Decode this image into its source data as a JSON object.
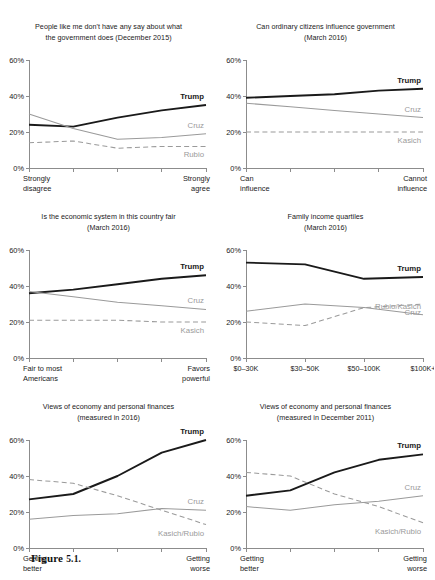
{
  "figure": {
    "caption_label": "Figure",
    "caption_number": "5.1."
  },
  "series_colors": {
    "trump": "#1a1a1a",
    "cruz": "#9a9a9a",
    "kasich": "#9a9a9a",
    "rubio": "#9a9a9a",
    "axis": "#8c8c8c",
    "text": "#1a1a1a",
    "gray_label": "#9a9a9a"
  },
  "chart_data": [
    {
      "type": "line",
      "id": "say-in-government",
      "title": "People like me don't have any say about what",
      "subtitle": "the government does (December 2015)",
      "x": [
        "1",
        "2",
        "3",
        "4",
        "5"
      ],
      "xtick_labels": [
        "",
        "",
        "",
        "",
        ""
      ],
      "xlabel_left": "Strongly",
      "xlabel_left2": "disagree",
      "xlabel_right": "Strongly",
      "xlabel_right2": "agree",
      "ylabel": "",
      "ylim": [
        0,
        60
      ],
      "yticks": [
        0,
        20,
        40,
        60
      ],
      "ytick_labels": [
        "0%",
        "20%",
        "40%",
        "60%"
      ],
      "grid": false,
      "legend_position": "inline-right",
      "series": [
        {
          "name": "Trump",
          "style": "solid-bold",
          "values": [
            24,
            23,
            28,
            32,
            35
          ]
        },
        {
          "name": "Cruz",
          "style": "solid-thin",
          "values": [
            30,
            22,
            16,
            17,
            19,
            17
          ]
        },
        {
          "name": "Rubio",
          "style": "dashed",
          "values": [
            14,
            15,
            11,
            12,
            12
          ]
        }
      ]
    },
    {
      "type": "line",
      "id": "ordinary-citizens-influence",
      "title": "Can ordinary citizens influence government",
      "subtitle": "(March 2016)",
      "x": [
        "1",
        "2",
        "3",
        "4",
        "5"
      ],
      "xlabel_left": "Can",
      "xlabel_left2": "influence",
      "xlabel_right": "Cannot",
      "xlabel_right2": "influence",
      "ylim": [
        0,
        60
      ],
      "yticks": [
        0,
        20,
        40,
        60
      ],
      "ytick_labels": [
        "0%",
        "20%",
        "40%",
        "60%"
      ],
      "grid": false,
      "legend_position": "inline-right",
      "series": [
        {
          "name": "Trump",
          "style": "solid-bold",
          "values": [
            39,
            40,
            41,
            43,
            44
          ]
        },
        {
          "name": "Cruz",
          "style": "solid-thin",
          "values": [
            36,
            34,
            32,
            30,
            28
          ]
        },
        {
          "name": "Kasich",
          "style": "dashed",
          "values": [
            20,
            20,
            20,
            20,
            20
          ]
        }
      ]
    },
    {
      "type": "line",
      "id": "economic-system-fair",
      "title": "Is the economic system in this country fair",
      "subtitle": "(March 2016)",
      "x": [
        "1",
        "2",
        "3",
        "4",
        "5"
      ],
      "xlabel_left": "Fair to most",
      "xlabel_left2": "Americans",
      "xlabel_right": "Favors",
      "xlabel_right2": "powerful",
      "ylim": [
        0,
        60
      ],
      "yticks": [
        0,
        20,
        40,
        60
      ],
      "ytick_labels": [
        "0%",
        "20%",
        "40%",
        "60%"
      ],
      "grid": false,
      "legend_position": "inline-right",
      "series": [
        {
          "name": "Trump",
          "style": "solid-bold",
          "values": [
            36,
            38,
            41,
            44,
            46
          ]
        },
        {
          "name": "Cruz",
          "style": "solid-thin",
          "values": [
            37,
            34,
            31,
            29,
            27
          ]
        },
        {
          "name": "Kasich",
          "style": "dashed",
          "values": [
            21,
            21,
            21,
            20,
            20
          ]
        }
      ]
    },
    {
      "type": "line",
      "id": "family-income-quartiles",
      "title": "Family income quartiles",
      "subtitle": "(March 2016)",
      "x": [
        "$0–30K",
        "$30–50K",
        "$50–100K",
        "$100K+"
      ],
      "xtick_labels": [
        "$0–30K",
        "$30–50K",
        "$50–100K",
        "$100K+"
      ],
      "ylim": [
        0,
        60
      ],
      "yticks": [
        0,
        20,
        40,
        60
      ],
      "ytick_labels": [
        "0%",
        "20%",
        "40%",
        "60%"
      ],
      "grid": false,
      "legend_position": "inline-right",
      "series": [
        {
          "name": "Trump",
          "style": "solid-bold",
          "values": [
            53,
            52,
            44,
            45
          ]
        },
        {
          "name": "Rubio/Kasich",
          "style": "solid-thin",
          "values": [
            26,
            30,
            28,
            24
          ]
        },
        {
          "name": "Cruz",
          "style": "dashed",
          "values": [
            20,
            18,
            28,
            30
          ]
        }
      ]
    },
    {
      "type": "line",
      "id": "views-economy-2016",
      "title": "Views of economy and personal finances",
      "subtitle": "(measured in 2016)",
      "x": [
        "1",
        "2",
        "3",
        "4",
        "5"
      ],
      "xlabel_left": "Getting",
      "xlabel_left2": "better",
      "xlabel_right": "Getting",
      "xlabel_right2": "worse",
      "ylim": [
        0,
        60
      ],
      "yticks": [
        0,
        20,
        40,
        60
      ],
      "ytick_labels": [
        "0%",
        "20%",
        "40%",
        "60%"
      ],
      "grid": false,
      "legend_position": "inline-right",
      "series": [
        {
          "name": "Trump",
          "style": "solid-bold",
          "values": [
            27,
            30,
            40,
            53,
            60
          ]
        },
        {
          "name": "Cruz",
          "style": "solid-thin",
          "values": [
            16,
            18,
            19,
            22,
            21
          ]
        },
        {
          "name": "Kasich/Rubio",
          "style": "dashed",
          "values": [
            38,
            36,
            29,
            21,
            13
          ]
        }
      ]
    },
    {
      "type": "line",
      "id": "views-economy-2011",
      "title": "Views of economy and personal finances",
      "subtitle": "(measured in December 2011)",
      "x": [
        "1",
        "2",
        "3",
        "4",
        "5"
      ],
      "xlabel_left": "Getting",
      "xlabel_left2": "better",
      "xlabel_right": "Getting",
      "xlabel_right2": "worse",
      "ylim": [
        0,
        60
      ],
      "yticks": [
        0,
        20,
        40,
        60
      ],
      "ytick_labels": [
        "0%",
        "20%",
        "40%",
        "60%"
      ],
      "grid": false,
      "legend_position": "inline-right",
      "series": [
        {
          "name": "Trump",
          "style": "solid-bold",
          "values": [
            29,
            32,
            42,
            49,
            52
          ]
        },
        {
          "name": "Cruz",
          "style": "solid-thin",
          "values": [
            23,
            21,
            24,
            26,
            29
          ]
        },
        {
          "name": "Kasich/Rubio",
          "style": "dashed",
          "values": [
            42,
            40,
            30,
            23,
            14
          ]
        }
      ]
    }
  ]
}
